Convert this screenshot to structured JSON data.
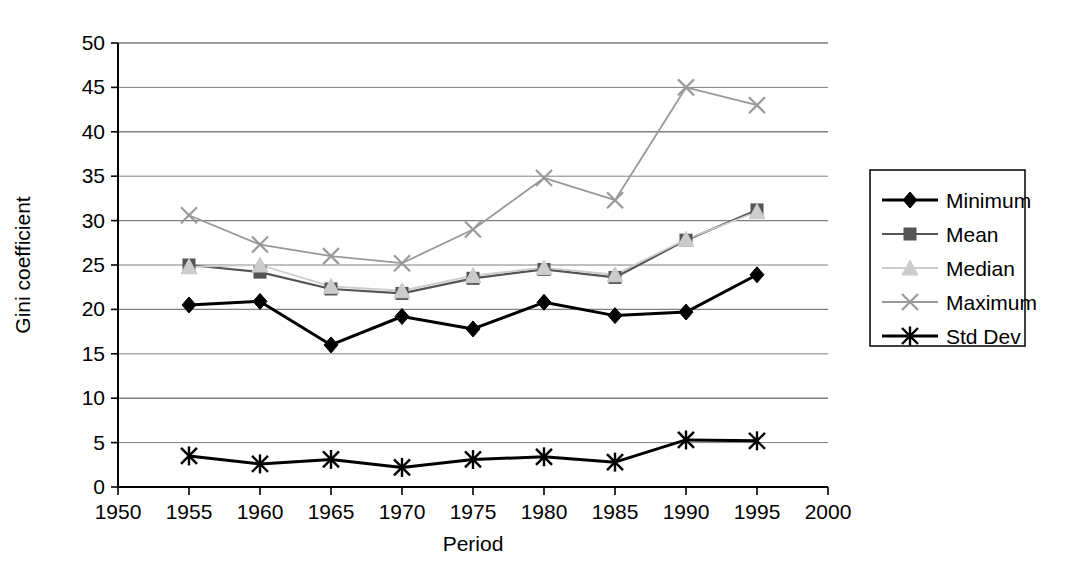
{
  "chart_data": {
    "type": "line",
    "title": "",
    "xlabel": "Period",
    "ylabel": "Gini coefficient",
    "xlim": [
      1950,
      2000
    ],
    "ylim": [
      0,
      50
    ],
    "xticks": [
      1950,
      1955,
      1960,
      1965,
      1970,
      1975,
      1980,
      1985,
      1990,
      1995,
      2000
    ],
    "yticks": [
      0,
      5,
      10,
      15,
      20,
      25,
      30,
      35,
      40,
      45,
      50
    ],
    "grid": "horizontal",
    "legend_position": "right",
    "x": [
      1955,
      1960,
      1965,
      1970,
      1975,
      1980,
      1985,
      1990,
      1995
    ],
    "series": [
      {
        "name": "Minimum",
        "marker": "diamond",
        "color": "#000000",
        "values": [
          20.5,
          20.9,
          16.0,
          19.2,
          17.8,
          20.8,
          19.3,
          19.7,
          23.9
        ]
      },
      {
        "name": "Mean",
        "marker": "square",
        "color": "#555555",
        "values": [
          25.0,
          24.2,
          22.3,
          21.8,
          23.5,
          24.5,
          23.6,
          27.8,
          31.2
        ]
      },
      {
        "name": "Median",
        "marker": "triangle",
        "color": "#cccccc",
        "values": [
          24.8,
          25.0,
          22.6,
          22.1,
          23.8,
          24.7,
          23.9,
          27.9,
          31.0
        ]
      },
      {
        "name": "Maximum",
        "marker": "cross",
        "color": "#999999",
        "values": [
          30.6,
          27.3,
          26.0,
          25.2,
          29.0,
          34.8,
          32.3,
          45.0,
          43.0
        ]
      },
      {
        "name": "Std Dev",
        "marker": "asterisk",
        "color": "#000000",
        "values": [
          3.5,
          2.6,
          3.1,
          2.2,
          3.1,
          3.4,
          2.8,
          5.3,
          5.2
        ]
      }
    ]
  },
  "axes": {
    "y_title": "Gini coefficient",
    "x_title": "Period"
  },
  "legend": {
    "items": [
      {
        "label": "Minimum"
      },
      {
        "label": "Mean"
      },
      {
        "label": "Median"
      },
      {
        "label": "Maximum"
      },
      {
        "label": "Std Dev"
      }
    ]
  },
  "colors": {
    "gridline": "#808080",
    "axis": "#000000",
    "background": "#ffffff"
  }
}
